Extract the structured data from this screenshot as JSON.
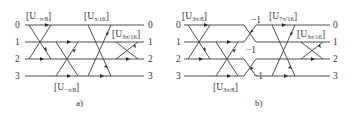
{
  "panels": [
    {
      "caption": "a)",
      "row_labels_left": [
        "0",
        "1",
        "2",
        "3"
      ],
      "row_labels_right": [
        "0",
        "1",
        "2",
        "3"
      ],
      "operators": [
        {
          "label_prefix": "[U",
          "subscript": "−π/8",
          "label_suffix": "]",
          "position": "top-left"
        },
        {
          "label_prefix": "[U",
          "subscript": "−π/8",
          "label_suffix": "]",
          "position": "bottom-middle"
        },
        {
          "label_prefix": "[U",
          "subscript": "π/16",
          "label_suffix": "]",
          "position": "top-middle"
        },
        {
          "label_prefix": "[U",
          "subscript": "3π/16",
          "label_suffix": "]",
          "position": "top-right"
        }
      ]
    },
    {
      "caption": "b)",
      "row_labels_left": [
        "0",
        "1",
        "2",
        "3"
      ],
      "row_labels_right": [
        "0",
        "1",
        "2",
        "3"
      ],
      "operators": [
        {
          "label_prefix": "[U",
          "subscript": "3π/8",
          "label_suffix": "]",
          "position": "top-left"
        },
        {
          "label_prefix": "[U",
          "subscript": "3π/8",
          "label_suffix": "]",
          "position": "bottom-middle"
        },
        {
          "label_prefix": "[U",
          "subscript": "7π/16",
          "label_suffix": "]",
          "position": "top-middle"
        },
        {
          "label_prefix": "[U",
          "subscript": "3π/16",
          "label_suffix": "]",
          "position": "top-right"
        }
      ],
      "phase_factors": [
        "−1",
        "−1",
        "−1"
      ]
    }
  ]
}
